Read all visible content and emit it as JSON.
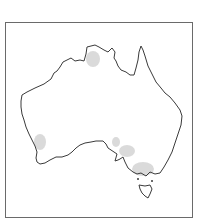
{
  "map": {
    "region": "Australia",
    "frame_color": "#6a6a6a",
    "coastline_color": "#3a3a3a",
    "highlight_color": "#d4d4d4",
    "highlight_regions": [
      {
        "name": "top-end-north",
        "cx": 93,
        "cy": 59,
        "rx": 7,
        "ry": 8
      },
      {
        "name": "south-west",
        "cx": 40,
        "cy": 142,
        "rx": 6,
        "ry": 8
      },
      {
        "name": "south-australia-gulf",
        "cx": 116,
        "cy": 142,
        "rx": 4,
        "ry": 5
      },
      {
        "name": "south-australia-east",
        "cx": 127,
        "cy": 151,
        "rx": 8,
        "ry": 6
      },
      {
        "name": "victoria",
        "cx": 143,
        "cy": 169,
        "rx": 11,
        "ry": 7
      }
    ]
  }
}
